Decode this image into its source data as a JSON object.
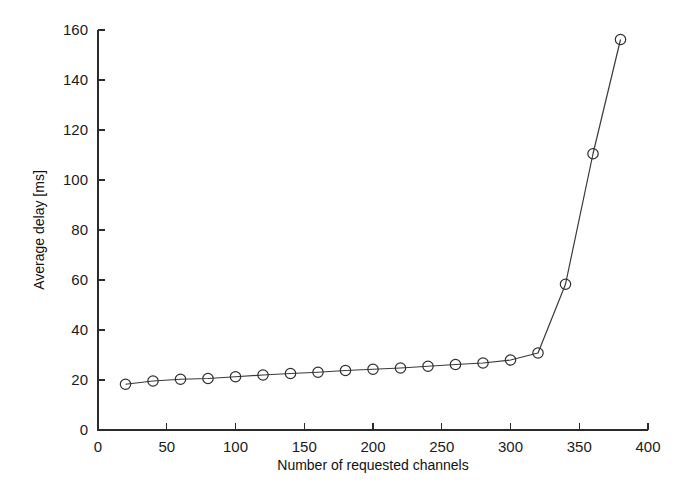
{
  "chart_data": {
    "type": "line",
    "title": "",
    "xlabel": "Number of requested channels",
    "ylabel": "Average delay [ms]",
    "xlim": [
      0,
      400
    ],
    "ylim": [
      0,
      160
    ],
    "xticks": [
      0,
      50,
      100,
      150,
      200,
      250,
      300,
      350,
      400
    ],
    "xticklabels": [
      "0",
      "50",
      "100",
      "150",
      "200",
      "250",
      "300",
      "350",
      "400"
    ],
    "yticks": [
      0,
      20,
      40,
      60,
      80,
      100,
      120,
      140,
      160
    ],
    "yticklabels": [
      "0",
      "20",
      "40",
      "60",
      "80",
      "100",
      "120",
      "140",
      "160"
    ],
    "grid": false,
    "legend": null,
    "marker": "circle",
    "line_color": "#3a3a3a",
    "marker_color": "#2e2e2e",
    "x": [
      20,
      40,
      60,
      80,
      100,
      120,
      140,
      160,
      180,
      200,
      220,
      240,
      260,
      280,
      300,
      320,
      340,
      360,
      380
    ],
    "values": [
      18.3,
      19.6,
      20.3,
      20.6,
      21.3,
      22.0,
      22.6,
      23.1,
      23.8,
      24.3,
      24.8,
      25.5,
      26.2,
      26.8,
      28.0,
      30.8,
      58.3,
      110.5,
      156.2
    ],
    "series": [
      {
        "name": "Average delay",
        "values": [
          18.3,
          19.6,
          20.3,
          20.6,
          21.3,
          22.0,
          22.6,
          23.1,
          23.8,
          24.3,
          24.8,
          25.5,
          26.2,
          26.8,
          28.0,
          30.8,
          58.3,
          110.5,
          156.2
        ]
      }
    ]
  },
  "axes": {
    "x_axis_name": "Number of requested channels",
    "y_axis_name": "Average delay [ms]"
  }
}
